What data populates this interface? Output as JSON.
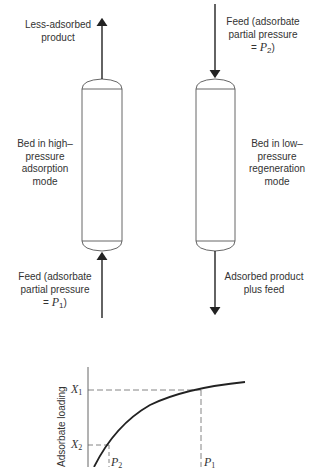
{
  "left_bed": {
    "top_label_line1": "Less-adsorbed",
    "top_label_line2": "product",
    "side_label_line1": "Bed in high–",
    "side_label_line2": "pressure",
    "side_label_line3": "adsorption",
    "side_label_line4": "mode",
    "bottom_label_line1": "Feed (adsorbate",
    "bottom_label_line2": "partial pressure",
    "bottom_label_eq": "= ",
    "bottom_label_sym": "P",
    "bottom_label_sub": "1",
    "bottom_label_close": ")"
  },
  "right_bed": {
    "top_label_line1": "Feed (adsorbate",
    "top_label_line2": "partial pressure",
    "top_label_eq": "= ",
    "top_label_sym": "P",
    "top_label_sub": "2",
    "top_label_close": ")",
    "side_label_line1": "Bed in low–",
    "side_label_line2": "pressure",
    "side_label_line3": "regeneration",
    "side_label_line4": "mode",
    "bottom_label_line1": "Adsorbed product",
    "bottom_label_line2": "plus feed"
  },
  "isotherm": {
    "ylabel": "Adsorbate loading",
    "x1_sym": "X",
    "x1_sub": "1",
    "x2_sym": "X",
    "x2_sub": "2",
    "p1_sym": "P",
    "p1_sub": "1",
    "p2_sym": "P",
    "p2_sub": "2"
  },
  "colors": {
    "line": "#222222",
    "vessel": "#555555",
    "dash": "#666666"
  }
}
